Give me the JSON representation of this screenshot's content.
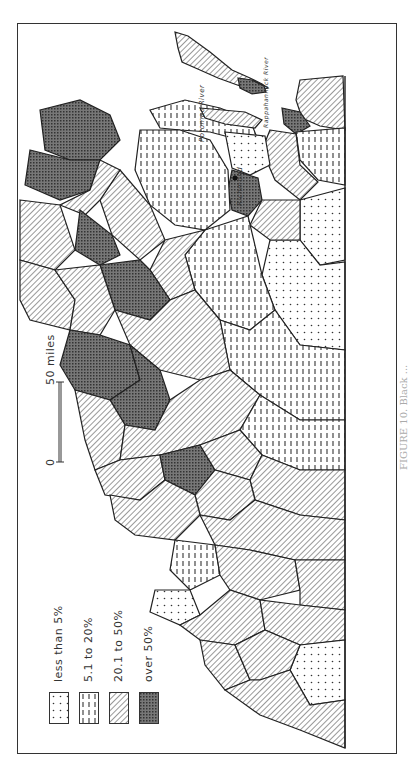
{
  "map": {
    "legend": {
      "items": [
        {
          "label": "less than 5%",
          "pattern": "dots"
        },
        {
          "label": "5.1  to  20%",
          "pattern": "dashes"
        },
        {
          "label": "20.1 to  50%",
          "pattern": "diagonal-hatch"
        },
        {
          "label": "over 50%",
          "pattern": "crosshatch"
        }
      ]
    },
    "scale_bar": {
      "start_label": "0",
      "end_label": "50 miles"
    },
    "place_labels": {
      "potomac": "Potomac River",
      "rappahannock": "Rappahannock River",
      "richmond": "Richmond",
      "york": "York River"
    },
    "caption": "FIGURE 10. Black ...",
    "colors": {
      "ink": "#333333",
      "paper": "#ffffff",
      "dark_fill": "#555555"
    }
  }
}
